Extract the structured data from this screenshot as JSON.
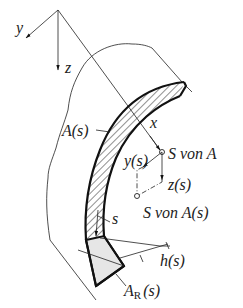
{
  "diagram": {
    "type": "curved-beam-cross-section",
    "axes": {
      "y": "y",
      "z": "z",
      "x": "x"
    },
    "labels": {
      "area_s": "A(s)",
      "ys": "y(s)",
      "zs": "z(s)",
      "s_von_A": "S von A",
      "s_von_As": "S von A(s)",
      "s": "s",
      "hs": "h(s)",
      "ar_main": "A",
      "ar_sub": "R",
      "ar_arg": "(s)"
    },
    "colors": {
      "ink": "#222222",
      "cross_section_fill": "#e6e6e6",
      "background": "#ffffff"
    }
  }
}
